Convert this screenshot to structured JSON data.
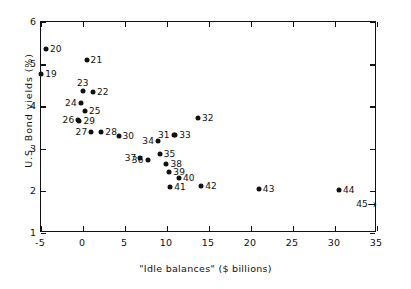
{
  "chart_data": {
    "type": "scatter",
    "title": "",
    "xlabel": "\"Idle balances\" ($ billions)",
    "ylabel": "U.S. Bond yields  (%)",
    "xlim": [
      -5,
      35
    ],
    "ylim": [
      1,
      6
    ],
    "xticks": [
      -5,
      0,
      5,
      10,
      15,
      20,
      25,
      30,
      35
    ],
    "xtick_labels": [
      "-5",
      "0",
      "5",
      "10",
      "15",
      "20",
      "25",
      "30",
      "35"
    ],
    "yticks": [
      1,
      2,
      3,
      4,
      5,
      6
    ],
    "ytick_labels": [
      "1",
      "2",
      "3",
      "4",
      "5",
      "6"
    ],
    "grid": false,
    "legend": "none",
    "point_label_key": "observation number",
    "points": [
      {
        "label": "19",
        "x": -4.85,
        "y": 4.75,
        "lpos": "r"
      },
      {
        "label": "20",
        "x": -4.3,
        "y": 5.33,
        "lpos": "r"
      },
      {
        "label": "21",
        "x": 0.55,
        "y": 5.07,
        "lpos": "r"
      },
      {
        "label": "22",
        "x": 1.3,
        "y": 4.31,
        "lpos": "r"
      },
      {
        "label": "23",
        "x": 0.1,
        "y": 4.35,
        "lpos": "t"
      },
      {
        "label": "24",
        "x": -0.15,
        "y": 4.05,
        "lpos": "l"
      },
      {
        "label": "25",
        "x": 0.35,
        "y": 3.86,
        "lpos": "r"
      },
      {
        "label": "26",
        "x": -0.45,
        "y": 3.66,
        "lpos": "l"
      },
      {
        "label": "27",
        "x": 1.1,
        "y": 3.37,
        "lpos": "l"
      },
      {
        "label": "28",
        "x": 2.3,
        "y": 3.36,
        "lpos": "r"
      },
      {
        "label": "29",
        "x": -0.3,
        "y": 3.62,
        "lpos": "r"
      },
      {
        "label": "30",
        "x": 4.35,
        "y": 3.28,
        "lpos": "r"
      },
      {
        "label": "31",
        "x": 10.9,
        "y": 3.31,
        "lpos": "l"
      },
      {
        "label": "32",
        "x": 13.8,
        "y": 3.71,
        "lpos": "r"
      },
      {
        "label": "33",
        "x": 11.1,
        "y": 3.3,
        "lpos": "r"
      },
      {
        "label": "34",
        "x": 9.05,
        "y": 3.16,
        "lpos": "l"
      },
      {
        "label": "35",
        "x": 9.25,
        "y": 2.86,
        "lpos": "r"
      },
      {
        "label": "36",
        "x": 7.8,
        "y": 2.7,
        "lpos": "l"
      },
      {
        "label": "37",
        "x": 6.95,
        "y": 2.76,
        "lpos": "l"
      },
      {
        "label": "38",
        "x": 10.05,
        "y": 2.61,
        "lpos": "r"
      },
      {
        "label": "39",
        "x": 10.4,
        "y": 2.43,
        "lpos": "r"
      },
      {
        "label": "40",
        "x": 11.55,
        "y": 2.29,
        "lpos": "r"
      },
      {
        "label": "41",
        "x": 10.5,
        "y": 2.06,
        "lpos": "r"
      },
      {
        "label": "42",
        "x": 14.2,
        "y": 2.1,
        "lpos": "r"
      },
      {
        "label": "43",
        "x": 21.05,
        "y": 2.01,
        "lpos": "r"
      },
      {
        "label": "44",
        "x": 30.6,
        "y": 2.0,
        "lpos": "r"
      },
      {
        "label": "45",
        "x": 34.5,
        "y": 1.67,
        "lpos": "l",
        "marker": "arrow-right"
      }
    ]
  }
}
